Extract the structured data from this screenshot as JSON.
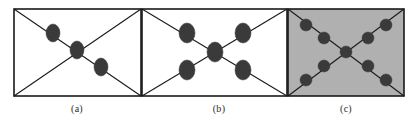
{
  "figure": {
    "width": 417,
    "height": 126,
    "background_color": "#ffffff",
    "stroke_color": "#1a1a1a",
    "node_fill_color": "#3a3a3a",
    "panel_fill_white": "#ffffff",
    "panel_fill_gray": "#b0b0b0"
  },
  "panels": [
    {
      "id": "a",
      "caption": "(a)",
      "rect": {
        "x": 14,
        "y": 9,
        "width": 127,
        "height": 87
      },
      "fill": "#ffffff",
      "diagonals": [
        "top-left-to-bottom-right",
        "bottom-left-to-top-right"
      ],
      "node_shape": "ellipse",
      "node_count": 3,
      "nodes": [
        {
          "cx": 53,
          "cy": 33,
          "rx": 7,
          "ry": 9
        },
        {
          "cx": 77,
          "cy": 50,
          "rx": 7,
          "ry": 9
        },
        {
          "cx": 101,
          "cy": 67,
          "rx": 7,
          "ry": 9
        }
      ]
    },
    {
      "id": "b",
      "caption": "(b)",
      "rect": {
        "x": 142,
        "y": 9,
        "width": 145,
        "height": 87
      },
      "fill": "#ffffff",
      "diagonals": [
        "top-left-to-bottom-right",
        "bottom-left-to-top-right"
      ],
      "node_shape": "ellipse",
      "node_count": 5,
      "nodes": [
        {
          "cx": 187,
          "cy": 33,
          "rx": 8,
          "ry": 10
        },
        {
          "cx": 243,
          "cy": 33,
          "rx": 8,
          "ry": 10
        },
        {
          "cx": 215,
          "cy": 52,
          "rx": 8,
          "ry": 10
        },
        {
          "cx": 187,
          "cy": 70,
          "rx": 8,
          "ry": 10
        },
        {
          "cx": 243,
          "cy": 70,
          "rx": 8,
          "ry": 10
        }
      ]
    },
    {
      "id": "c",
      "caption": "(c)",
      "rect": {
        "x": 288,
        "y": 9,
        "width": 116,
        "height": 87
      },
      "fill": "#b0b0b0",
      "diagonals": [
        "top-left-to-bottom-right",
        "bottom-left-to-top-right"
      ],
      "node_shape": "circle",
      "node_count": 9,
      "nodes": [
        {
          "cx": 306,
          "cy": 25,
          "rx": 6,
          "ry": 6
        },
        {
          "cx": 324,
          "cy": 38,
          "rx": 6,
          "ry": 6
        },
        {
          "cx": 386,
          "cy": 25,
          "rx": 6,
          "ry": 6
        },
        {
          "cx": 368,
          "cy": 38,
          "rx": 6,
          "ry": 6
        },
        {
          "cx": 346,
          "cy": 52,
          "rx": 6,
          "ry": 6
        },
        {
          "cx": 324,
          "cy": 66,
          "rx": 6,
          "ry": 6
        },
        {
          "cx": 306,
          "cy": 80,
          "rx": 6,
          "ry": 6
        },
        {
          "cx": 368,
          "cy": 66,
          "rx": 6,
          "ry": 6
        },
        {
          "cx": 386,
          "cy": 80,
          "rx": 6,
          "ry": 6
        }
      ]
    }
  ]
}
